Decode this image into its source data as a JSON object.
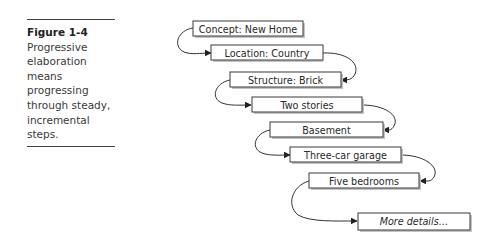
{
  "caption": {
    "figure_number": "Figure 1-4",
    "text": "Progressive elaboration means progressing through steady, incremental steps."
  },
  "diagram": {
    "title": "Progressive elaboration",
    "steps": [
      {
        "label": "Concept: New Home"
      },
      {
        "label": "Location: Country"
      },
      {
        "label": "Structure: Brick"
      },
      {
        "label": "Two stories"
      },
      {
        "label": "Basement"
      },
      {
        "label": "Three-car garage"
      },
      {
        "label": "Five bedrooms"
      },
      {
        "label": "More details…"
      }
    ],
    "colors": {
      "box_border": "#3a3a3a",
      "box_fill": "#ffffff",
      "shadow": "#bdbdbd",
      "connector": "#333333"
    }
  }
}
